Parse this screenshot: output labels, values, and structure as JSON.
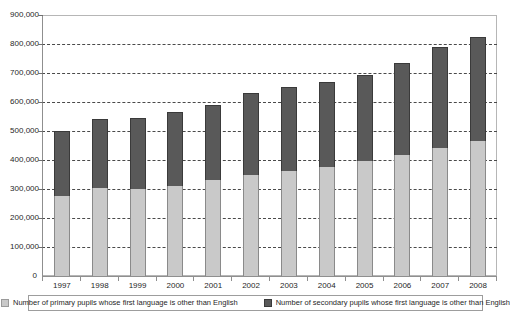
{
  "chart_data": {
    "type": "bar",
    "subtype": "stacked-column",
    "title": "",
    "xlabel": "",
    "ylabel": "",
    "categories": [
      "1997",
      "1998",
      "1999",
      "2000",
      "2001",
      "2002",
      "2003",
      "2004",
      "2005",
      "2006",
      "2007",
      "2008"
    ],
    "series": [
      {
        "name": "Number of primary pupils whose first language is other than English",
        "color": "#c9c9c9",
        "values": [
          275000,
          303000,
          300000,
          310000,
          330000,
          350000,
          363000,
          375000,
          395000,
          417000,
          443000,
          466000
        ]
      },
      {
        "name": "Number of secondary pupils whose first language is other than English",
        "color": "#595959",
        "values": [
          225000,
          238000,
          244000,
          257000,
          260000,
          281000,
          290000,
          293000,
          299000,
          317000,
          347000,
          357000
        ]
      }
    ],
    "totals": [
      500000,
      541000,
      544000,
      567000,
      590000,
      631000,
      653000,
      668000,
      694000,
      734000,
      790000,
      823000
    ],
    "ylim": [
      0,
      900000
    ],
    "ytick_values": [
      0,
      100000,
      200000,
      300000,
      400000,
      500000,
      600000,
      700000,
      800000,
      900000
    ],
    "ytick_labels": [
      "0",
      "100,000",
      "200,000",
      "300,000",
      "400,000",
      "500,000",
      "600,000",
      "700,000",
      "800,000",
      "900,000"
    ],
    "grid": true,
    "grid_style": "dashed-horizontal",
    "legend_position": "bottom"
  },
  "legend": {
    "entries": [
      {
        "label": "Number of primary pupils whose first language is other than English",
        "swatch": "primary"
      },
      {
        "label": "Number of secondary pupils whose first language is other than English",
        "swatch": "secondary"
      }
    ]
  },
  "colors": {
    "primary_series": "#c9c9c9",
    "secondary_series": "#595959",
    "gridline": "#4a4a4a",
    "axis": "#8f8f8f",
    "frame": "#b6b6b6",
    "text": "#1f1f1f"
  }
}
